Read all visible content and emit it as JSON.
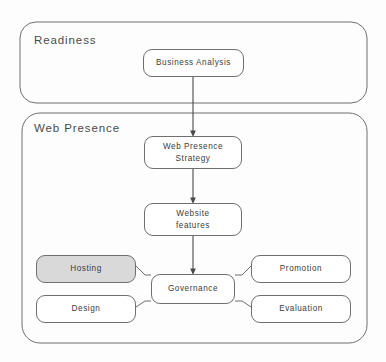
{
  "diagram": {
    "title_visible": false,
    "type": "flowchart",
    "background_color": "#fdfdfd",
    "groups": [
      {
        "id": "readiness",
        "label": "Readiness",
        "x": 20,
        "y": 22,
        "w": 347,
        "h": 81
      },
      {
        "id": "web-presence",
        "label": "Web Presence",
        "x": 22,
        "y": 113,
        "w": 345,
        "h": 230
      }
    ],
    "nodes": [
      {
        "id": "business-analysis",
        "label": "Business Analysis",
        "lines": [
          "Business Analysis"
        ],
        "x": 143,
        "y": 49,
        "w": 101,
        "h": 28,
        "fill": "#ffffff",
        "shaded": false
      },
      {
        "id": "web-presence-strategy",
        "label": "Web Presence Strategy",
        "lines": [
          "Web Presence",
          "Strategy"
        ],
        "x": 144,
        "y": 136,
        "w": 98,
        "h": 33,
        "fill": "#ffffff",
        "shaded": false
      },
      {
        "id": "website-features",
        "label": "Website features",
        "lines": [
          "Website",
          "features"
        ],
        "x": 144,
        "y": 203,
        "w": 98,
        "h": 33,
        "fill": "#ffffff",
        "shaded": false
      },
      {
        "id": "hosting",
        "label": "Hosting",
        "lines": [
          "Hosting"
        ],
        "x": 36,
        "y": 255,
        "w": 100,
        "h": 28,
        "fill": "#d9d9d9",
        "shaded": true
      },
      {
        "id": "design",
        "label": "Design",
        "lines": [
          "Design"
        ],
        "x": 36,
        "y": 295,
        "w": 100,
        "h": 28,
        "fill": "#ffffff",
        "shaded": false
      },
      {
        "id": "governance",
        "label": "Governance",
        "lines": [
          "Governance"
        ],
        "x": 151,
        "y": 274,
        "w": 84,
        "h": 30,
        "fill": "#ffffff",
        "shaded": false
      },
      {
        "id": "promotion",
        "label": "Promotion",
        "lines": [
          "Promotion"
        ],
        "x": 251,
        "y": 255,
        "w": 100,
        "h": 28,
        "fill": "#ffffff",
        "shaded": false
      },
      {
        "id": "evaluation",
        "label": "Evaluation",
        "lines": [
          "Evaluation"
        ],
        "x": 251,
        "y": 295,
        "w": 100,
        "h": 28,
        "fill": "#ffffff",
        "shaded": false
      }
    ],
    "connectors": [
      {
        "id": "business-analysis-to-strategy",
        "from": "business-analysis",
        "to": "web-presence-strategy",
        "style": "arrow-down"
      },
      {
        "id": "strategy-to-website-features",
        "from": "web-presence-strategy",
        "to": "website-features",
        "style": "arrow-down"
      },
      {
        "id": "website-features-to-governance",
        "from": "website-features",
        "to": "governance",
        "style": "arrow-down"
      },
      {
        "id": "hosting-to-governance",
        "from": "hosting",
        "to": "governance",
        "style": "elbow"
      },
      {
        "id": "design-to-governance",
        "from": "design",
        "to": "governance",
        "style": "elbow"
      },
      {
        "id": "governance-to-promotion",
        "from": "governance",
        "to": "promotion",
        "style": "elbow"
      },
      {
        "id": "governance-to-evaluation",
        "from": "governance",
        "to": "evaluation",
        "style": "elbow"
      }
    ],
    "colors": {
      "stroke": "#6f6f6f",
      "text": "#3c3c3c",
      "group_label": "#4a4a4a",
      "shaded_fill": "#d9d9d9",
      "node_fill": "#ffffff"
    }
  }
}
